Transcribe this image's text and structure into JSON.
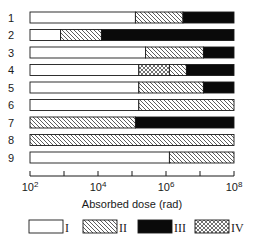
{
  "chart_data": {
    "type": "bar",
    "orientation": "horizontal-stacked",
    "title": "",
    "xlabel": "Absorbed dose (rad)",
    "ylabel": "",
    "xscale": "log",
    "xlim_exponent": [
      2,
      8
    ],
    "xticks": [
      {
        "exp": 2,
        "label_base": "10",
        "label_exp": "2"
      },
      {
        "exp": 3,
        "label_base": "",
        "label_exp": ""
      },
      {
        "exp": 4,
        "label_base": "10",
        "label_exp": "4"
      },
      {
        "exp": 5,
        "label_base": "",
        "label_exp": ""
      },
      {
        "exp": 6,
        "label_base": "10",
        "label_exp": "6"
      },
      {
        "exp": 7,
        "label_base": "",
        "label_exp": ""
      },
      {
        "exp": 8,
        "label_base": "10",
        "label_exp": "8"
      }
    ],
    "grid": false,
    "legend_position": "bottom",
    "legend": [
      {
        "key": "I",
        "label": "I",
        "fill": "white"
      },
      {
        "key": "II",
        "label": "II",
        "fill": "hatch"
      },
      {
        "key": "III",
        "label": "III",
        "fill": "black"
      },
      {
        "key": "IV",
        "label": "IV",
        "fill": "crosshatch"
      }
    ],
    "categories": [
      "1",
      "2",
      "3",
      "4",
      "5",
      "6",
      "7",
      "8",
      "9"
    ],
    "rows": [
      {
        "label": "1",
        "segments": [
          {
            "class": "I",
            "from_exp": 2,
            "to_exp": 5.1
          },
          {
            "class": "II",
            "from_exp": 5.1,
            "to_exp": 6.5
          },
          {
            "class": "III",
            "from_exp": 6.5,
            "to_exp": 8
          }
        ]
      },
      {
        "label": "2",
        "segments": [
          {
            "class": "I",
            "from_exp": 2,
            "to_exp": 2.9
          },
          {
            "class": "II",
            "from_exp": 2.9,
            "to_exp": 4.1
          },
          {
            "class": "III",
            "from_exp": 4.1,
            "to_exp": 8
          }
        ]
      },
      {
        "label": "3",
        "segments": [
          {
            "class": "I",
            "from_exp": 2,
            "to_exp": 5.4
          },
          {
            "class": "II",
            "from_exp": 5.4,
            "to_exp": 7.1
          },
          {
            "class": "III",
            "from_exp": 7.1,
            "to_exp": 8
          }
        ]
      },
      {
        "label": "4",
        "segments": [
          {
            "class": "I",
            "from_exp": 2,
            "to_exp": 5.2
          },
          {
            "class": "IV",
            "from_exp": 5.2,
            "to_exp": 6.1
          },
          {
            "class": "II",
            "from_exp": 6.1,
            "to_exp": 6.6
          },
          {
            "class": "III",
            "from_exp": 6.6,
            "to_exp": 8
          }
        ]
      },
      {
        "label": "5",
        "segments": [
          {
            "class": "I",
            "from_exp": 2,
            "to_exp": 5.2
          },
          {
            "class": "II",
            "from_exp": 5.2,
            "to_exp": 7.1
          },
          {
            "class": "III",
            "from_exp": 7.1,
            "to_exp": 8
          }
        ]
      },
      {
        "label": "6",
        "segments": [
          {
            "class": "I",
            "from_exp": 2,
            "to_exp": 5.2
          },
          {
            "class": "II",
            "from_exp": 5.2,
            "to_exp": 8
          }
        ]
      },
      {
        "label": "7",
        "segments": [
          {
            "class": "II",
            "from_exp": 2,
            "to_exp": 5.1
          },
          {
            "class": "III",
            "from_exp": 5.1,
            "to_exp": 8
          }
        ]
      },
      {
        "label": "8",
        "segments": [
          {
            "class": "II",
            "from_exp": 2,
            "to_exp": 8
          }
        ]
      },
      {
        "label": "9",
        "segments": [
          {
            "class": "I",
            "from_exp": 2,
            "to_exp": 6.1
          },
          {
            "class": "II",
            "from_exp": 6.1,
            "to_exp": 8
          }
        ]
      }
    ]
  },
  "layout": {
    "x0": 30,
    "x1": 234,
    "row_top": 12,
    "row_step": 17.5,
    "bar_h": 11,
    "axis_y": 176,
    "legend_y": 220
  },
  "colors": {
    "ink": "#1a1a1a",
    "white": "#ffffff",
    "black": "#0a0a0a"
  }
}
